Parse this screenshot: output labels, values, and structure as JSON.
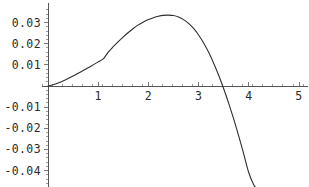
{
  "chart_data": {
    "type": "line",
    "title": "",
    "subtitle": "",
    "xlabel": "",
    "ylabel": "",
    "xlim": [
      -0.12,
      5.18
    ],
    "ylim": [
      -0.0482,
      0.0345
    ],
    "grid": false,
    "legend": null,
    "x_ticks_major": [
      1,
      2,
      3,
      4,
      5
    ],
    "x_tick_labels": [
      "1",
      "2",
      "3",
      "4",
      "5"
    ],
    "y_ticks_major": [
      0.03,
      0.02,
      0.01,
      -0.01,
      -0.02,
      -0.03,
      -0.04
    ],
    "y_tick_labels": [
      "0.03",
      "0.02",
      "0.01",
      "-0.01",
      "-0.02",
      "-0.03",
      "-0.04"
    ],
    "x_ticks_minor_step": 0.2,
    "y_ticks_minor_step": 0.002,
    "series": [
      {
        "name": "curve",
        "color": "#2e2e2e",
        "x": [
          0.0,
          0.1,
          0.2,
          0.3,
          0.4,
          0.5,
          0.6,
          0.7,
          0.8,
          0.9,
          1.0,
          1.1,
          1.2,
          1.3,
          1.4,
          1.5,
          1.6,
          1.7,
          1.8,
          1.9,
          2.0,
          2.1,
          2.2,
          2.3,
          2.4,
          2.5,
          2.6,
          2.7,
          2.8,
          2.9,
          3.0,
          3.1,
          3.2,
          3.3,
          3.4,
          3.5,
          3.6,
          3.7,
          3.8,
          3.9,
          4.0,
          4.1,
          4.15
        ],
        "y": [
          0.0,
          0.0006,
          0.0014,
          0.0024,
          0.0035,
          0.0047,
          0.006,
          0.0073,
          0.0086,
          0.01,
          0.0114,
          0.0128,
          0.016,
          0.0186,
          0.021,
          0.0232,
          0.0253,
          0.0272,
          0.0289,
          0.0303,
          0.0314,
          0.0323,
          0.033,
          0.0334,
          0.0335,
          0.0333,
          0.0326,
          0.0314,
          0.0296,
          0.0272,
          0.0241,
          0.0203,
          0.0159,
          0.0108,
          0.0051,
          -0.0013,
          -0.0082,
          -0.0157,
          -0.0237,
          -0.0322,
          -0.041,
          -0.0468,
          -0.0482
        ],
        "zero_crossings": [
          0.0,
          3.58
        ],
        "maximum": {
          "x": 2.4,
          "y": 0.0335
        },
        "end_point": {
          "x": 4.15,
          "y": -0.0482
        }
      }
    ],
    "axis_color": "#555555",
    "background": "#ffffff"
  },
  "figure": {
    "origin_px": {
      "x": 48,
      "y": 86
    },
    "x_unit_px": 50.2,
    "y_unit_px": 2115
  }
}
